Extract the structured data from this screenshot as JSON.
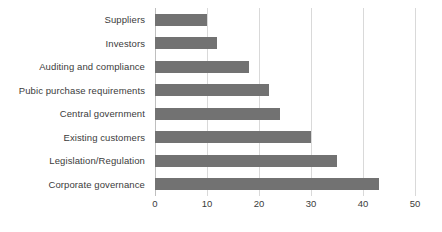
{
  "chart_data": {
    "type": "bar",
    "orientation": "horizontal",
    "title": "",
    "subtitle": "",
    "xlabel": "",
    "ylabel": "",
    "categories": [
      "Suppliers",
      "Investors",
      "Auditing and compliance",
      "Pubic purchase requirements",
      "Central government",
      "Existing customers",
      "Legislation/Regulation",
      "Corporate governance"
    ],
    "values": [
      10,
      12,
      18,
      22,
      24,
      30,
      35,
      43
    ],
    "xlim": [
      0,
      50
    ],
    "xticks": [
      0,
      10,
      20,
      30,
      40,
      50
    ],
    "xtick_labels": [
      "0",
      "10",
      "20",
      "30",
      "40",
      "50"
    ],
    "grid": "vertical",
    "legend": "none",
    "bar_color": "#727272",
    "gridline_color": "#d9d9d9",
    "axis_color": "#bfbfbf",
    "background_color": "#ffffff",
    "text_color": "#3b3b3b"
  }
}
